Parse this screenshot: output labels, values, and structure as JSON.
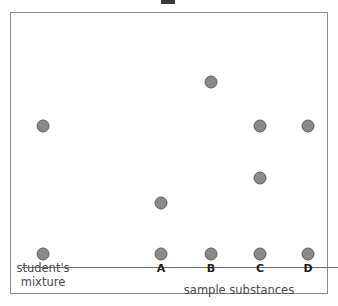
{
  "figure": {
    "kind": "paper-chromatogram",
    "plate_border_color": "#8d8d8d",
    "baseline_color": "#6e6e6e",
    "spot_fill_color": "#8a8a8a",
    "spot_stroke_color": "#5e5e5e",
    "background_color": "#ffffff"
  },
  "labels": {
    "mixture_line1": "student's",
    "mixture_line2": "mixture",
    "axis_caption": "sample substances",
    "columns": [
      "A",
      "B",
      "C",
      "D"
    ]
  },
  "chart_data": {
    "type": "scatter",
    "title": "",
    "xlabel": "sample substances",
    "ylabel": "",
    "grid": false,
    "legend": "none",
    "xlim": [
      0,
      338
    ],
    "ylim": [
      0,
      306
    ],
    "note": "Paper chromatogram: each lane is a vertical track; circles are separated spots. Lane origins sit on the baseline; travel distance is measured upward from the baseline.",
    "baseline_y": 254,
    "lanes": [
      {
        "name": "student's mixture",
        "x": 43,
        "origin_spot": {
          "x": 43,
          "y": 254
        },
        "spots": [
          {
            "x": 43,
            "y": 126,
            "travel": 128
          }
        ]
      },
      {
        "name": "A",
        "x": 161,
        "origin_spot": {
          "x": 161,
          "y": 254
        },
        "spots": [
          {
            "x": 161,
            "y": 203,
            "travel": 51
          }
        ]
      },
      {
        "name": "B",
        "x": 211,
        "origin_spot": {
          "x": 211,
          "y": 254
        },
        "spots": [
          {
            "x": 211,
            "y": 82,
            "travel": 172
          }
        ]
      },
      {
        "name": "C",
        "x": 260,
        "origin_spot": {
          "x": 260,
          "y": 254
        },
        "spots": [
          {
            "x": 260,
            "y": 126,
            "travel": 128
          },
          {
            "x": 260,
            "y": 178,
            "travel": 76
          }
        ]
      },
      {
        "name": "D",
        "x": 308,
        "origin_spot": {
          "x": 308,
          "y": 254
        },
        "spots": [
          {
            "x": 308,
            "y": 126,
            "travel": 128
          }
        ]
      }
    ]
  }
}
